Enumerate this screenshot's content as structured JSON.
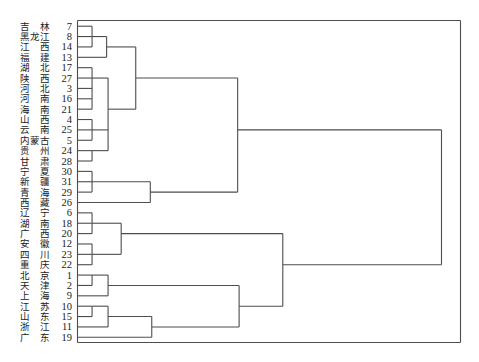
{
  "style": {
    "line_color": "#4d4d4d",
    "text_color": "#222222",
    "background": "#ffffff"
  },
  "chart_data": {
    "type": "dendrogram",
    "orientation": "horizontal",
    "title": "",
    "xlabel": "",
    "ylabel": "",
    "axis_shown": false,
    "grid": false,
    "frame": true,
    "level_range": [
      0,
      25
    ],
    "leaves": [
      {
        "name": "吉林",
        "id": 7
      },
      {
        "name": "黑龙江",
        "id": 8
      },
      {
        "name": "江西",
        "id": 14
      },
      {
        "name": "福建",
        "id": 13
      },
      {
        "name": "湖北",
        "id": 17
      },
      {
        "name": "陕西",
        "id": 27
      },
      {
        "name": "河北",
        "id": 3
      },
      {
        "name": "河南",
        "id": 16
      },
      {
        "name": "海南",
        "id": 21
      },
      {
        "name": "山西",
        "id": 4
      },
      {
        "name": "云南",
        "id": 25
      },
      {
        "name": "内蒙古",
        "id": 5
      },
      {
        "name": "贵州",
        "id": 24
      },
      {
        "name": "甘肃",
        "id": 28
      },
      {
        "name": "宁夏",
        "id": 30
      },
      {
        "name": "新疆",
        "id": 31
      },
      {
        "name": "青海",
        "id": 29
      },
      {
        "name": "西藏",
        "id": 26
      },
      {
        "name": "辽宁",
        "id": 6
      },
      {
        "name": "湖南",
        "id": 18
      },
      {
        "name": "广西",
        "id": 20
      },
      {
        "name": "安徽",
        "id": 12
      },
      {
        "name": "四川",
        "id": 23
      },
      {
        "name": "重庆",
        "id": 22
      },
      {
        "name": "北京",
        "id": 1
      },
      {
        "name": "天津",
        "id": 2
      },
      {
        "name": "上海",
        "id": 9
      },
      {
        "name": "江苏",
        "id": 10
      },
      {
        "name": "山东",
        "id": 15
      },
      {
        "name": "浙江",
        "id": 11
      },
      {
        "name": "广东",
        "id": 19
      }
    ],
    "merges": [
      {
        "id": "m1",
        "children": [
          7,
          8,
          14
        ],
        "level": 1.0,
        "out_row": 1
      },
      {
        "id": "m2",
        "children": [
          "m1",
          13
        ],
        "level": 2.0,
        "out_row": 2
      },
      {
        "id": "m3",
        "children": [
          17,
          27,
          3,
          16,
          21
        ],
        "level": 1.0,
        "out_row": 5
      },
      {
        "id": "m4",
        "children": [
          4,
          25,
          5
        ],
        "level": 1.0,
        "out_row": 10
      },
      {
        "id": "m5",
        "children": [
          24,
          28
        ],
        "level": 1.0,
        "out_row": 12
      },
      {
        "id": "m6",
        "children": [
          "m3",
          "m4",
          "m5"
        ],
        "level": 2.1,
        "out_row": 8
      },
      {
        "id": "m7",
        "children": [
          "m2",
          "m6"
        ],
        "level": 4.0,
        "out_row": 5
      },
      {
        "id": "m8",
        "children": [
          30,
          31,
          29
        ],
        "level": 1.0,
        "out_row": 15
      },
      {
        "id": "m9",
        "children": [
          "m8",
          26
        ],
        "level": 5.0,
        "out_row": 16
      },
      {
        "id": "m10",
        "children": [
          "m7",
          "m9"
        ],
        "level": 11.0,
        "out_row": 10
      },
      {
        "id": "m11",
        "children": [
          6,
          18,
          20
        ],
        "level": 1.0,
        "out_row": 19
      },
      {
        "id": "m12",
        "children": [
          12,
          23,
          22
        ],
        "level": 1.0,
        "out_row": 22
      },
      {
        "id": "m13",
        "children": [
          "m11",
          "m12"
        ],
        "level": 3.0,
        "out_row": 20
      },
      {
        "id": "m14",
        "children": [
          1,
          2
        ],
        "level": 1.0,
        "out_row": 24
      },
      {
        "id": "m15",
        "children": [
          "m14",
          9
        ],
        "level": 2.1,
        "out_row": 25
      },
      {
        "id": "m16",
        "children": [
          10,
          15
        ],
        "level": 1.0,
        "out_row": 27
      },
      {
        "id": "m17",
        "children": [
          "m16",
          11
        ],
        "level": 2.1,
        "out_row": 28
      },
      {
        "id": "m18",
        "children": [
          "m17",
          19
        ],
        "level": 5.1,
        "out_row": 29
      },
      {
        "id": "m19",
        "children": [
          "m15",
          "m18"
        ],
        "level": 11.1,
        "out_row": 27
      },
      {
        "id": "m20",
        "children": [
          "m13",
          "m19"
        ],
        "level": 14.1,
        "out_row": 23
      },
      {
        "id": "m21",
        "children": [
          "m10",
          "m20"
        ],
        "level": 25.0,
        "out_row": null
      }
    ],
    "clusters_at_top_split": [
      [
        "吉林",
        "黑龙江",
        "江西",
        "福建",
        "湖北",
        "陕西",
        "河北",
        "河南",
        "海南",
        "山西",
        "云南",
        "内蒙古",
        "贵州",
        "甘肃",
        "宁夏",
        "新疆",
        "青海",
        "西藏"
      ],
      [
        "辽宁",
        "湖南",
        "广西",
        "安徽",
        "四川",
        "重庆",
        "北京",
        "天津",
        "上海",
        "江苏",
        "山东",
        "浙江",
        "广东"
      ]
    ]
  }
}
